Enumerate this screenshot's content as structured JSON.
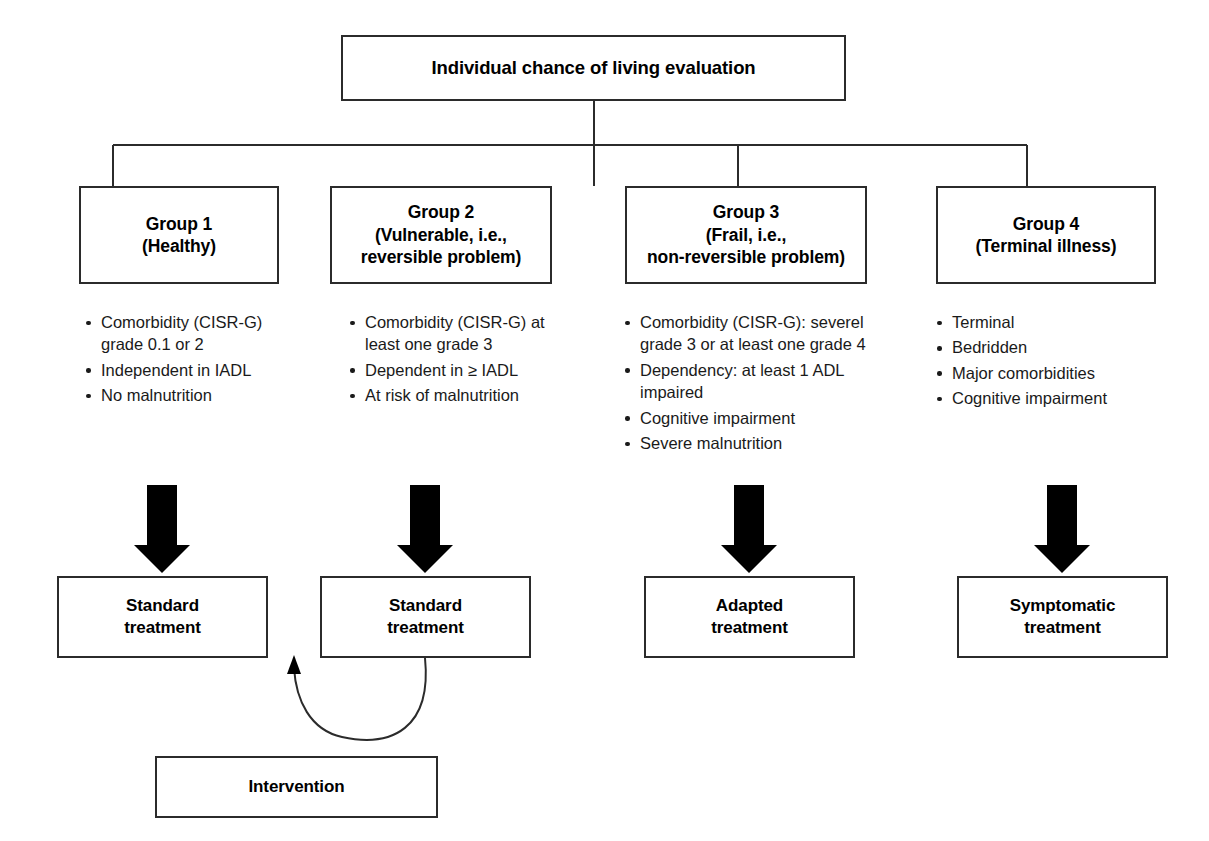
{
  "diagram": {
    "title": "Individual chance of living evaluation",
    "root": {
      "label": "Individual chance of living evaluation"
    },
    "groups": [
      {
        "id": "group-1",
        "label": "Group 1\n(Healthy)",
        "criteria": [
          "Comorbidity (CISR-G) grade 0.1 or 2",
          "Independent in IADL",
          "No malnutrition"
        ],
        "treatment": "Standard\ntreatment"
      },
      {
        "id": "group-2",
        "label": "Group 2\n(Vulnerable, i.e.,\nreversible problem)",
        "criteria": [
          "Comorbidity (CISR-G) at least one grade 3",
          "Dependent in ≥ IADL",
          "At risk of malnutrition"
        ],
        "treatment": "Standard\ntreatment"
      },
      {
        "id": "group-3",
        "label": "Group 3\n(Frail, i.e.,\nnon-reversible problem)",
        "criteria": [
          "Comorbidity (CISR-G): severel grade 3 or at least one grade 4",
          "Dependency: at least 1 ADL impaired",
          "Cognitive impairment",
          "Severe malnutrition"
        ],
        "treatment": "Adapted\ntreatment"
      },
      {
        "id": "group-4",
        "label": "Group 4\n(Terminal illness)",
        "criteria": [
          "Terminal",
          "Bedridden",
          "Major comorbidities",
          "Cognitive impairment"
        ],
        "treatment": "Symptomatic\ntreatment"
      }
    ],
    "intervention": {
      "label": "Intervention"
    },
    "colors": {
      "stroke": "#2b2b2b",
      "arrow_fill": "#000000",
      "text": "#000000",
      "background": "#ffffff"
    }
  }
}
